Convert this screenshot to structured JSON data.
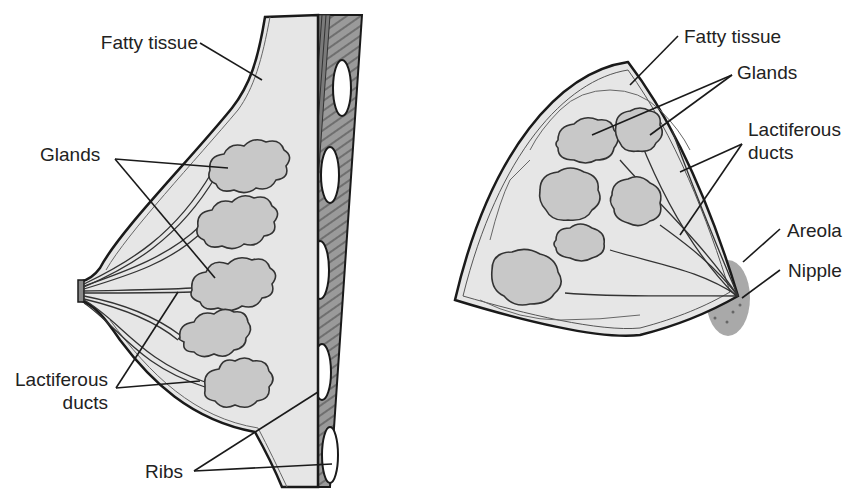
{
  "diagram": {
    "title": "",
    "colors": {
      "background": "#ffffff",
      "tissue_fill": "#e6e6e6",
      "gland_fill": "#c8c8c8",
      "outline": "#1a1a1a",
      "chest_wall": "#8a8a8a",
      "rib_fill": "#ffffff",
      "areola_fill": "#9a9a9a",
      "label_text": "#222222"
    },
    "panels": [
      {
        "id": "side-view",
        "labels": {
          "fatty_tissue": "Fatty tissue",
          "glands": "Glands",
          "lactiferous_line1": "Lactiferous",
          "lactiferous_line2": "ducts",
          "ribs": "Ribs"
        }
      },
      {
        "id": "front-view",
        "labels": {
          "fatty_tissue": "Fatty tissue",
          "glands": "Glands",
          "lactiferous_line1": "Lactiferous",
          "lactiferous_line2": "ducts",
          "areola": "Areola",
          "nipple": "Nipple"
        }
      }
    ]
  }
}
